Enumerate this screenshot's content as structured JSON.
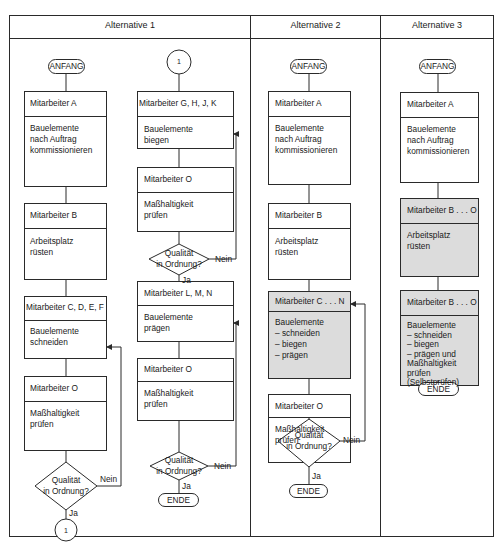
{
  "colors": {
    "line": "#2a2a2a",
    "shaded": "#dcdcdc",
    "background": "#ffffff"
  },
  "columns": [
    {
      "title": "Alternative 1"
    },
    {
      "title": "Alternative 2"
    },
    {
      "title": "Alternative 3"
    }
  ],
  "alt1": {
    "left": {
      "start": "ANFANG",
      "steps": [
        {
          "worker": "Mitarbeiter A",
          "task_lines": [
            "Bauelemente",
            "nach Auftrag",
            "kommissionieren"
          ]
        },
        {
          "worker": "Mitarbeiter B",
          "task_lines": [
            "Arbeitsplatz",
            "rüsten"
          ]
        },
        {
          "worker": "Mitarbeiter C, D, E, F",
          "task_lines": [
            "Bauelemente",
            "schneiden"
          ]
        },
        {
          "worker": "Mitarbeiter O",
          "task_lines": [
            "Maßhaltigkeit",
            "prüfen"
          ]
        }
      ],
      "decision": {
        "lines": [
          "Qualität",
          "in Ordnung?"
        ],
        "no": "Nein",
        "yes": "Ja"
      },
      "connector": "1"
    },
    "right": {
      "connector": "1",
      "steps": [
        {
          "worker": "Mitarbeiter G, H, J, K",
          "task_lines": [
            "Bauelemente",
            "biegen"
          ]
        },
        {
          "worker": "Mitarbeiter O",
          "task_lines": [
            "Maßhaltigkeit",
            "prüfen"
          ]
        },
        {
          "worker": "Mitarbeiter L, M, N",
          "task_lines": [
            "Bauelemente",
            "prägen"
          ]
        },
        {
          "worker": "Mitarbeiter O",
          "task_lines": [
            "Maßhaltigkeit",
            "prüfen"
          ]
        }
      ],
      "decision1": {
        "lines": [
          "Qualität",
          "in Ordnung?"
        ],
        "no": "Nein",
        "yes": "Ja"
      },
      "decision2": {
        "lines": [
          "Qualität",
          "in Ordnung?"
        ],
        "no": "Nein",
        "yes": "Ja"
      },
      "end": "ENDE"
    }
  },
  "alt2": {
    "start": "ANFANG",
    "steps": [
      {
        "worker": "Mitarbeiter A",
        "task_lines": [
          "Bauelemente",
          "nach Auftrag",
          "kommissionieren"
        ]
      },
      {
        "worker": "Mitarbeiter B",
        "task_lines": [
          "Arbeitsplatz",
          "rüsten"
        ]
      },
      {
        "worker": "Mitarbeiter C . . . N",
        "task_lines": [
          "Bauelemente",
          "–  schneiden",
          "–  biegen",
          "–  prägen"
        ],
        "shaded": true
      },
      {
        "worker": "Mitarbeiter O",
        "task_lines": [
          "Maßhaltigkeit",
          "prüfen"
        ]
      }
    ],
    "decision": {
      "lines": [
        "Qualität",
        "in Ordnung?"
      ],
      "no": "Nein",
      "yes": "Ja"
    },
    "end": "ENDE"
  },
  "alt3": {
    "start": "ANFANG",
    "steps": [
      {
        "worker": "Mitarbeiter A",
        "task_lines": [
          "Bauelemente",
          "nach Auftrag",
          "kommissionieren"
        ]
      },
      {
        "worker": "Mitarbeiter B . . . O",
        "task_lines": [
          "Arbeitsplatz",
          "rüsten"
        ],
        "shaded": true
      },
      {
        "worker": "Mitarbeiter B . . . O",
        "task_lines": [
          "Bauelemente",
          "–  schneiden",
          "–  biegen",
          "–  prägen und",
          "Maßhaltigkeit",
          "prüfen",
          "(Selbstprüfen)"
        ],
        "shaded": true
      }
    ],
    "end": "ENDE"
  }
}
